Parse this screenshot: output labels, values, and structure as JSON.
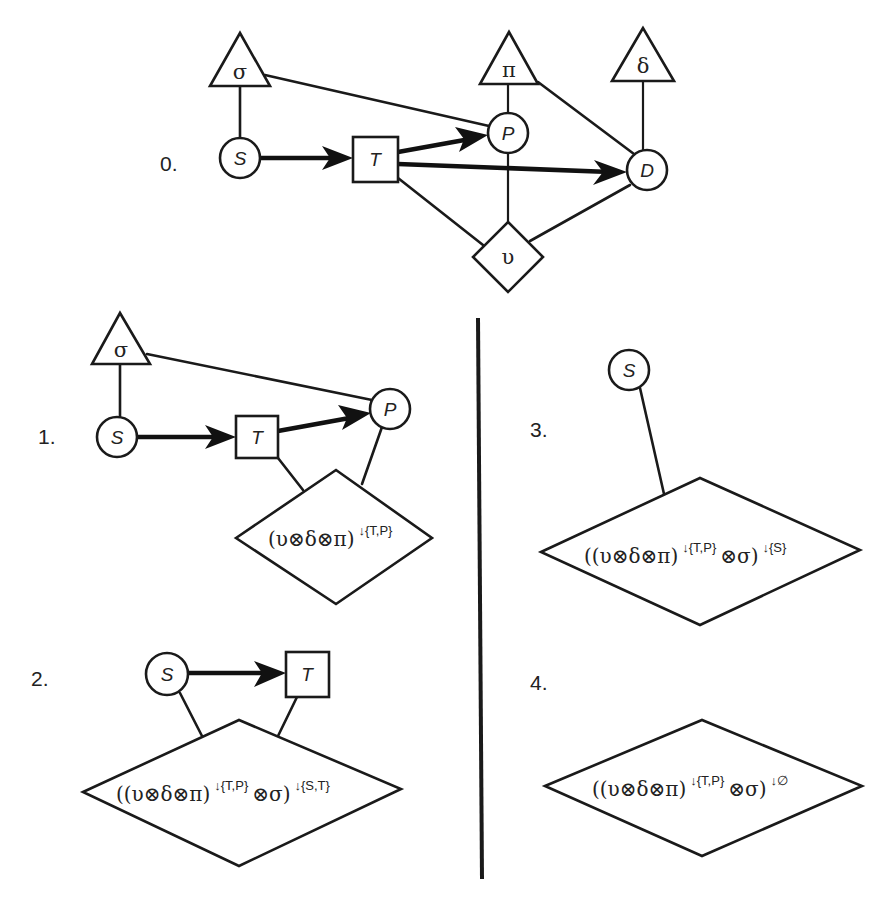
{
  "figure": {
    "panels": [
      {
        "label": "0.",
        "nodes": [
          {
            "id": "sigma",
            "shape": "triangle",
            "text": "σ"
          },
          {
            "id": "pi",
            "shape": "triangle",
            "text": "π"
          },
          {
            "id": "delta",
            "shape": "triangle",
            "text": "δ"
          },
          {
            "id": "S",
            "shape": "circle",
            "text": "S"
          },
          {
            "id": "T",
            "shape": "square",
            "text": "T"
          },
          {
            "id": "P",
            "shape": "circle",
            "text": "P"
          },
          {
            "id": "D",
            "shape": "circle",
            "text": "D"
          },
          {
            "id": "upsilon",
            "shape": "diamond",
            "text": "υ"
          }
        ],
        "edges": [
          {
            "from": "sigma",
            "to": "S",
            "type": "undirected"
          },
          {
            "from": "sigma",
            "to": "P",
            "type": "undirected"
          },
          {
            "from": "pi",
            "to": "P",
            "type": "undirected"
          },
          {
            "from": "pi",
            "to": "D",
            "type": "undirected"
          },
          {
            "from": "delta",
            "to": "D",
            "type": "undirected"
          },
          {
            "from": "S",
            "to": "T",
            "type": "directed"
          },
          {
            "from": "T",
            "to": "P",
            "type": "directed"
          },
          {
            "from": "T",
            "to": "D",
            "type": "directed"
          },
          {
            "from": "T",
            "to": "upsilon",
            "type": "undirected"
          },
          {
            "from": "P",
            "to": "upsilon",
            "type": "undirected"
          },
          {
            "from": "D",
            "to": "upsilon",
            "type": "undirected"
          }
        ]
      },
      {
        "label": "1.",
        "nodes": [
          {
            "id": "sigma",
            "shape": "triangle",
            "text": "σ"
          },
          {
            "id": "S",
            "shape": "circle",
            "text": "S"
          },
          {
            "id": "T",
            "shape": "square",
            "text": "T"
          },
          {
            "id": "P",
            "shape": "circle",
            "text": "P"
          },
          {
            "id": "potential",
            "shape": "diamond",
            "text": "(υ⊗δ⊗π)",
            "superscript": "↓{T,P}"
          }
        ],
        "edges": [
          {
            "from": "sigma",
            "to": "S",
            "type": "undirected"
          },
          {
            "from": "sigma",
            "to": "P",
            "type": "undirected"
          },
          {
            "from": "S",
            "to": "T",
            "type": "directed"
          },
          {
            "from": "T",
            "to": "P",
            "type": "directed"
          },
          {
            "from": "T",
            "to": "potential",
            "type": "undirected"
          },
          {
            "from": "P",
            "to": "potential",
            "type": "undirected"
          }
        ]
      },
      {
        "label": "2.",
        "nodes": [
          {
            "id": "S",
            "shape": "circle",
            "text": "S"
          },
          {
            "id": "T",
            "shape": "square",
            "text": "T"
          },
          {
            "id": "potential",
            "shape": "diamond",
            "text_prefix": "((υ⊗δ⊗π)",
            "sup1": "↓{T,P}",
            "text_mid": "⊗σ)",
            "sup2": "↓{S,T}"
          }
        ],
        "edges": [
          {
            "from": "S",
            "to": "T",
            "type": "directed"
          },
          {
            "from": "S",
            "to": "potential",
            "type": "undirected"
          },
          {
            "from": "T",
            "to": "potential",
            "type": "undirected"
          }
        ]
      },
      {
        "label": "3.",
        "nodes": [
          {
            "id": "S",
            "shape": "circle",
            "text": "S"
          },
          {
            "id": "potential",
            "shape": "diamond",
            "text_prefix": "((υ⊗δ⊗π)",
            "sup1": "↓{T,P}",
            "text_mid": "⊗σ)",
            "sup2": "↓{S}"
          }
        ],
        "edges": [
          {
            "from": "S",
            "to": "potential",
            "type": "undirected"
          }
        ]
      },
      {
        "label": "4.",
        "nodes": [
          {
            "id": "potential",
            "shape": "diamond",
            "text_prefix": "((υ⊗δ⊗π)",
            "sup1": "↓{T,P}",
            "text_mid": "⊗σ)",
            "sup2": "↓∅"
          }
        ],
        "edges": []
      }
    ]
  },
  "colors": {
    "ink": "#1a1a1a",
    "background": "#ffffff"
  }
}
